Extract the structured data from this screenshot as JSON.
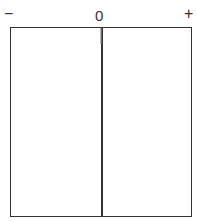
{
  "scale": {
    "negative_label": "−",
    "zero_label": "0",
    "positive_label": "+"
  },
  "colors": {
    "line": "#333333",
    "background": "#ffffff"
  }
}
